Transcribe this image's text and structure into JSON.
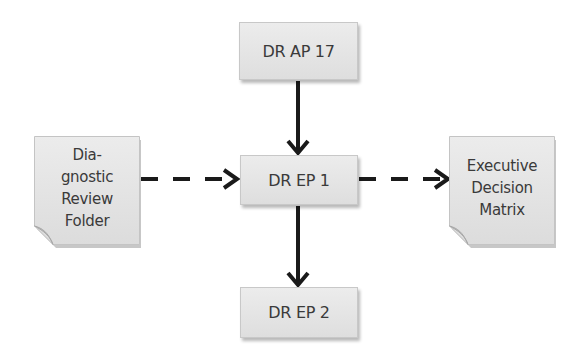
{
  "diagram": {
    "type": "flowchart",
    "nodes": {
      "dr_ap_17": {
        "label": "DR AP 17",
        "shape": "rectangle"
      },
      "dr_ep_1": {
        "label": "DR EP 1",
        "shape": "rectangle"
      },
      "dr_ep_2": {
        "label": "DR EP 2",
        "shape": "rectangle"
      },
      "diagnostic_review_folder": {
        "shape": "document",
        "lines": [
          "Dia-",
          "gnostic",
          "Review",
          "Folder"
        ]
      },
      "executive_decision_matrix": {
        "shape": "document",
        "lines": [
          "Executive",
          "Decision",
          "Matrix"
        ]
      }
    },
    "edges": [
      {
        "from": "DR AP 17",
        "to": "DR EP 1",
        "style": "solid"
      },
      {
        "from": "DR EP 1",
        "to": "DR EP 2",
        "style": "solid"
      },
      {
        "from": "Diagnostic Review Folder",
        "to": "DR EP 1",
        "style": "dashed"
      },
      {
        "from": "DR EP 1",
        "to": "Executive Decision Matrix",
        "style": "dashed"
      }
    ],
    "colors": {
      "node_fill": "#e4e4e4",
      "node_border": "#c8c8c8",
      "text": "#3a3a3a",
      "edge": "#1a1a1a"
    }
  }
}
